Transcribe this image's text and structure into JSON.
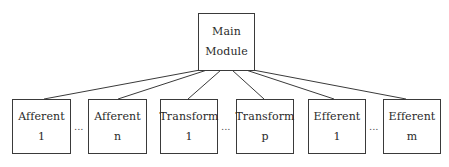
{
  "diagram": {
    "type": "hierarchy-tree",
    "root": {
      "id": "main",
      "line1": "Main",
      "line2": "Module"
    },
    "children": [
      {
        "id": "afferent-1",
        "line1": "Afferent",
        "line2": "1"
      },
      {
        "id": "afferent-n",
        "line1": "Afferent",
        "line2": "n"
      },
      {
        "id": "transform-1",
        "line1": "Transform",
        "line2": "1"
      },
      {
        "id": "transform-p",
        "line1": "Transform",
        "line2": "p"
      },
      {
        "id": "efferent-1",
        "line1": "Efferent",
        "line2": "1"
      },
      {
        "id": "efferent-m",
        "line1": "Efferent",
        "line2": "m"
      }
    ],
    "ellipses": [
      "...",
      "...",
      "..."
    ],
    "edges": [
      {
        "from": "main",
        "to": "afferent-1"
      },
      {
        "from": "main",
        "to": "afferent-n"
      },
      {
        "from": "main",
        "to": "transform-1"
      },
      {
        "from": "main",
        "to": "transform-p"
      },
      {
        "from": "main",
        "to": "efferent-1"
      },
      {
        "from": "main",
        "to": "efferent-m"
      }
    ],
    "colors": {
      "stroke": "#3a3a3a",
      "text": "#2a2a2a",
      "background": "#ffffff"
    }
  }
}
